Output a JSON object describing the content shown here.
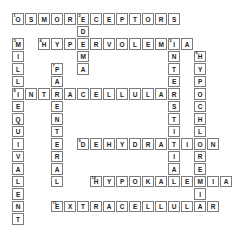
{
  "puzzle": {
    "type": "crossword",
    "grid": {
      "rows": 17,
      "cols": 17,
      "cell_w": 13.0,
      "cell_h": 12.5,
      "origin_x": 12,
      "origin_y": 13
    },
    "colors": {
      "background": "#ffffff",
      "cell_fill": "#ffffff",
      "cell_border": "#7c7c7c",
      "letter": "#222222",
      "clue_number": "#222222"
    },
    "words": [
      {
        "number": 1,
        "answer": "OSMORECEPTORS",
        "direction": "across",
        "row": 0,
        "col": 0
      },
      {
        "number": 2,
        "answer": "EDEMA",
        "direction": "down",
        "row": 0,
        "col": 5
      },
      {
        "number": 3,
        "answer": "MILLIEQUIVALENT",
        "direction": "down",
        "row": 2,
        "col": 0
      },
      {
        "number": 4,
        "answer": "HYPERVOLEMIA",
        "direction": "across",
        "row": 2,
        "col": 2
      },
      {
        "number": 5,
        "answer": "INTERSTITIAL",
        "direction": "down",
        "row": 2,
        "col": 12
      },
      {
        "number": 6,
        "answer": "HYPOCHLOREMIA",
        "direction": "down",
        "row": 3,
        "col": 14
      },
      {
        "number": 7,
        "answer": "PARENTERAL",
        "direction": "down",
        "row": 4,
        "col": 3
      },
      {
        "number": 8,
        "answer": "INTRACELLULAR",
        "direction": "across",
        "row": 6,
        "col": 0
      },
      {
        "number": 9,
        "answer": "DEHYDRATION",
        "direction": "across",
        "row": 10,
        "col": 5
      },
      {
        "number": 10,
        "answer": "HYPOKALEMIA",
        "direction": "across",
        "row": 13,
        "col": 6
      },
      {
        "number": 11,
        "answer": "EXTRACELLULAR",
        "direction": "across",
        "row": 15,
        "col": 3
      }
    ]
  }
}
